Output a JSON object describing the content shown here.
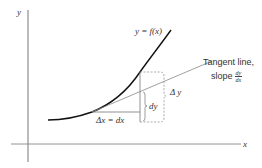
{
  "diagram": {
    "type": "derivative-differential-illustration",
    "axes": {
      "x_label": "x",
      "y_label": "y"
    },
    "curve_label": "y = f(x)",
    "dx_label": "Δx = dx",
    "dy_label": "dy",
    "delta_y_label": "Δ y",
    "tangent_label_line1": "Tangent line,",
    "tangent_label_slope": "slope",
    "slope_numerator": "dy",
    "slope_denominator": "dx",
    "colors": {
      "curve": "#111111",
      "axes": "#555555",
      "tangent": "#777777",
      "dashed": "#777777",
      "text": "#333333"
    }
  }
}
